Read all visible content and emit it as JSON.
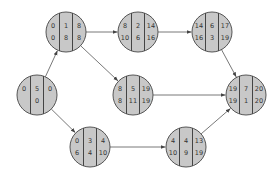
{
  "diagram": {
    "type": "activity-on-node network (critical path)",
    "node_style": {
      "fill": "#c8c8c8",
      "stroke": "#555555"
    },
    "nodes": [
      {
        "id": "n1",
        "cx": 37,
        "cy": 95,
        "top": [
          "0",
          "5",
          "0"
        ],
        "bottom": [
          "",
          "0",
          ""
        ]
      },
      {
        "id": "n2",
        "cx": 66,
        "cy": 32,
        "top": [
          "0",
          "1",
          "8"
        ],
        "bottom": [
          "0",
          "8",
          "8"
        ]
      },
      {
        "id": "n3",
        "cx": 138,
        "cy": 32,
        "top": [
          "8",
          "2",
          "14"
        ],
        "bottom": [
          "10",
          "6",
          "16"
        ]
      },
      {
        "id": "n4",
        "cx": 212,
        "cy": 32,
        "top": [
          "14",
          "6",
          "17"
        ],
        "bottom": [
          "16",
          "3",
          "19"
        ]
      },
      {
        "id": "n5",
        "cx": 133,
        "cy": 95,
        "top": [
          "8",
          "5",
          "19"
        ],
        "bottom": [
          "8",
          "11",
          "19"
        ]
      },
      {
        "id": "n6",
        "cx": 246,
        "cy": 95,
        "top": [
          "19",
          "7",
          "20"
        ],
        "bottom": [
          "19",
          "1",
          "20"
        ]
      },
      {
        "id": "n7",
        "cx": 90,
        "cy": 147,
        "top": [
          "0",
          "3",
          "4"
        ],
        "bottom": [
          "6",
          "4",
          "10"
        ]
      },
      {
        "id": "n8",
        "cx": 186,
        "cy": 147,
        "top": [
          "4",
          "4",
          "13"
        ],
        "bottom": [
          "10",
          "9",
          "19"
        ]
      }
    ],
    "edges": [
      {
        "from": "n1",
        "to": "n2"
      },
      {
        "from": "n1",
        "to": "n7"
      },
      {
        "from": "n2",
        "to": "n3"
      },
      {
        "from": "n2",
        "to": "n5"
      },
      {
        "from": "n3",
        "to": "n4"
      },
      {
        "from": "n4",
        "to": "n6"
      },
      {
        "from": "n5",
        "to": "n6"
      },
      {
        "from": "n7",
        "to": "n8"
      },
      {
        "from": "n8",
        "to": "n6"
      }
    ]
  }
}
